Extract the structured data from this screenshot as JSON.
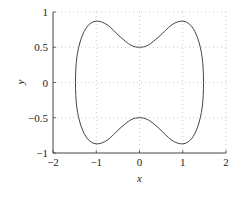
{
  "chart_data": {
    "type": "line",
    "title": "",
    "xlabel": "x",
    "ylabel": "y",
    "xlim": [
      -2,
      2
    ],
    "ylim": [
      -1,
      1
    ],
    "xticks": [
      "-2",
      "-1",
      "0",
      "1",
      "2"
    ],
    "yticks": [
      "1",
      "0.5",
      "0",
      "-0.5",
      "-1"
    ],
    "grid": true,
    "legend": null,
    "series": [
      {
        "name": "closed curve",
        "color": "#444444",
        "points": [
          [
            -1.48,
            0.0
          ],
          [
            -1.45,
            0.35
          ],
          [
            -1.35,
            0.62
          ],
          [
            -1.2,
            0.8
          ],
          [
            -1.0,
            0.87
          ],
          [
            -0.75,
            0.82
          ],
          [
            -0.45,
            0.65
          ],
          [
            -0.2,
            0.53
          ],
          [
            0.0,
            0.5
          ],
          [
            0.2,
            0.53
          ],
          [
            0.45,
            0.65
          ],
          [
            0.75,
            0.82
          ],
          [
            1.0,
            0.87
          ],
          [
            1.2,
            0.8
          ],
          [
            1.35,
            0.62
          ],
          [
            1.45,
            0.35
          ],
          [
            1.48,
            0.0
          ],
          [
            1.45,
            -0.35
          ],
          [
            1.35,
            -0.62
          ],
          [
            1.2,
            -0.8
          ],
          [
            1.0,
            -0.87
          ],
          [
            0.75,
            -0.82
          ],
          [
            0.45,
            -0.65
          ],
          [
            0.2,
            -0.53
          ],
          [
            0.0,
            -0.5
          ],
          [
            -0.2,
            -0.53
          ],
          [
            -0.45,
            -0.65
          ],
          [
            -0.75,
            -0.82
          ],
          [
            -1.0,
            -0.87
          ],
          [
            -1.2,
            -0.8
          ],
          [
            -1.35,
            -0.62
          ],
          [
            -1.45,
            -0.35
          ],
          [
            -1.48,
            0.0
          ]
        ]
      }
    ]
  },
  "axes": {
    "x_label": "x",
    "y_label": "y",
    "x_ticks": [
      "−2",
      "−1",
      "0",
      "1",
      "2"
    ],
    "y_ticks": [
      "1",
      "0.5",
      "0",
      "−0.5",
      "−1"
    ]
  }
}
